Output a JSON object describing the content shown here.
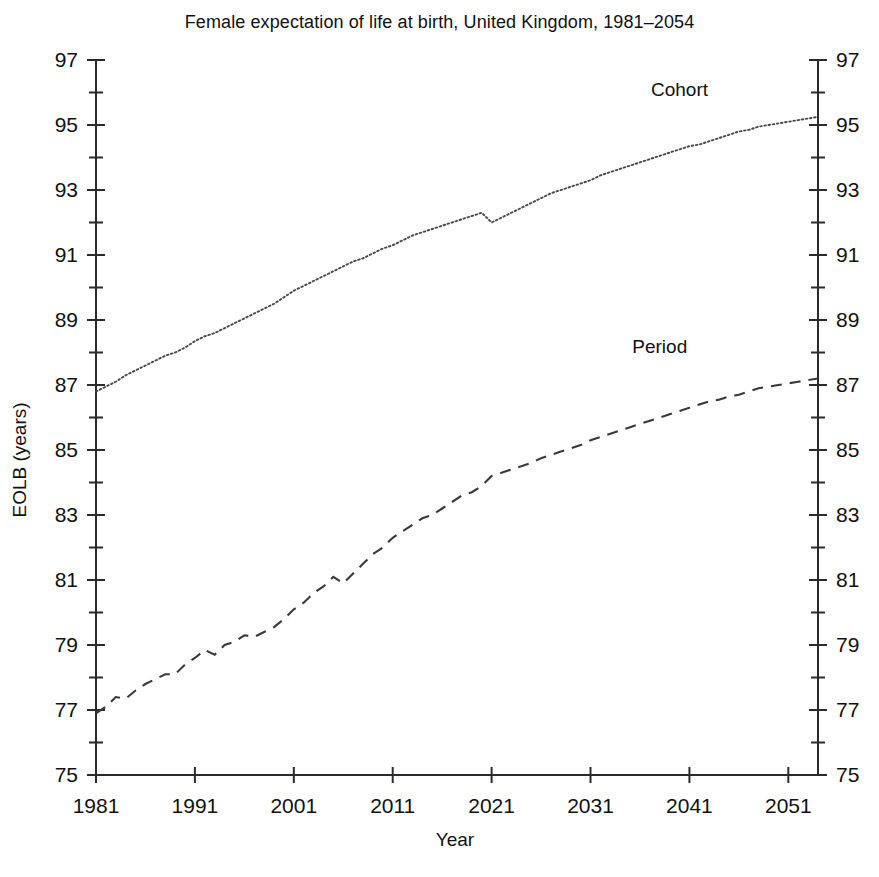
{
  "chart_data": {
    "type": "line",
    "title": "Female expectation of life at birth, United Kingdom, 1981–2054",
    "xlabel": "Year",
    "ylabel": "EOLB (years)",
    "xlim": [
      1981,
      2054
    ],
    "ylim": [
      75,
      97
    ],
    "grid": false,
    "legend_position": "inline-right-of-series",
    "y_tick_labels": [
      "97",
      "95",
      "93",
      "91",
      "89",
      "87",
      "85",
      "83",
      "81",
      "79",
      "77",
      "75"
    ],
    "y_major_ticks": [
      97,
      95,
      93,
      91,
      89,
      87,
      85,
      83,
      81,
      79,
      77,
      75
    ],
    "y_minor_ticks": [
      96,
      94,
      92,
      90,
      88,
      86,
      84,
      82,
      80,
      78,
      76
    ],
    "y_axis_duplicated_right": true,
    "x_tick_labels": [
      "1981",
      "1991",
      "2001",
      "2011",
      "2021",
      "2031",
      "2041",
      "2051"
    ],
    "x_major_ticks": [
      1981,
      1991,
      2001,
      2011,
      2021,
      2031,
      2041,
      2051
    ],
    "annotations": [
      {
        "text": "Cohort",
        "year": 2040,
        "value": 95.9
      },
      {
        "text": "Period",
        "year": 2038,
        "value": 88.0
      }
    ],
    "x": [
      1981,
      1982,
      1983,
      1984,
      1985,
      1986,
      1987,
      1988,
      1989,
      1990,
      1991,
      1992,
      1993,
      1994,
      1995,
      1996,
      1997,
      1998,
      1999,
      2000,
      2001,
      2002,
      2003,
      2004,
      2005,
      2006,
      2007,
      2008,
      2009,
      2010,
      2011,
      2012,
      2013,
      2014,
      2015,
      2016,
      2017,
      2018,
      2019,
      2020,
      2021,
      2022,
      2023,
      2024,
      2025,
      2026,
      2027,
      2028,
      2029,
      2030,
      2031,
      2032,
      2033,
      2034,
      2035,
      2036,
      2037,
      2038,
      2039,
      2040,
      2041,
      2042,
      2043,
      2044,
      2045,
      2046,
      2047,
      2048,
      2049,
      2050,
      2051,
      2052,
      2053,
      2054
    ],
    "series": [
      {
        "name": "Cohort",
        "style": "dotted",
        "values": [
          86.8,
          86.95,
          87.1,
          87.3,
          87.45,
          87.6,
          87.75,
          87.9,
          88.0,
          88.15,
          88.35,
          88.5,
          88.6,
          88.75,
          88.9,
          89.05,
          89.2,
          89.35,
          89.5,
          89.7,
          89.9,
          90.05,
          90.2,
          90.35,
          90.5,
          90.65,
          90.8,
          90.9,
          91.05,
          91.2,
          91.3,
          91.45,
          91.6,
          91.7,
          91.8,
          91.9,
          92.0,
          92.1,
          92.2,
          92.3,
          92.0,
          92.15,
          92.3,
          92.45,
          92.6,
          92.75,
          92.9,
          93.0,
          93.1,
          93.2,
          93.3,
          93.45,
          93.55,
          93.65,
          93.75,
          93.85,
          93.95,
          94.05,
          94.15,
          94.25,
          94.35,
          94.4,
          94.5,
          94.6,
          94.7,
          94.8,
          94.85,
          94.95,
          95.0,
          95.05,
          95.1,
          95.15,
          95.2,
          95.25
        ]
      },
      {
        "name": "Period",
        "style": "dashed",
        "values": [
          76.9,
          77.1,
          77.4,
          77.35,
          77.6,
          77.8,
          77.95,
          78.1,
          78.1,
          78.4,
          78.6,
          78.85,
          78.7,
          79.0,
          79.1,
          79.3,
          79.25,
          79.4,
          79.55,
          79.8,
          80.1,
          80.3,
          80.6,
          80.8,
          81.1,
          80.9,
          81.2,
          81.5,
          81.8,
          82.0,
          82.3,
          82.5,
          82.7,
          82.9,
          83.0,
          83.2,
          83.4,
          83.6,
          83.7,
          83.9,
          84.2,
          84.3,
          84.4,
          84.5,
          84.6,
          84.75,
          84.85,
          84.95,
          85.05,
          85.15,
          85.3,
          85.4,
          85.5,
          85.6,
          85.7,
          85.8,
          85.9,
          86.0,
          86.1,
          86.2,
          86.3,
          86.4,
          86.5,
          86.55,
          86.65,
          86.7,
          86.8,
          86.9,
          86.95,
          87.0,
          87.05,
          87.1,
          87.15,
          87.2
        ]
      }
    ]
  }
}
